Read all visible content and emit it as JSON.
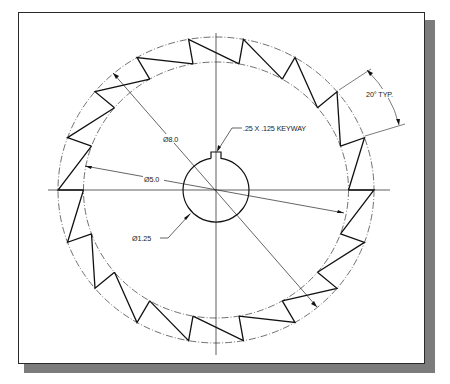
{
  "drawing": {
    "title": "Ratchet wheel detail",
    "center": {
      "x": 216,
      "y": 190
    },
    "outer_circle": {
      "rx": 158,
      "ry": 153,
      "label": "Ø8.0",
      "style": "dash-dot"
    },
    "root_circle": {
      "rx": 132.5,
      "ry": 128,
      "label": "Ø5.0",
      "style": "dash-dot"
    },
    "bore": {
      "rx": 33,
      "ry": 32,
      "label": "Ø1.25"
    },
    "keyway": {
      "label": ".25 X .125 KEYWAY",
      "half_width": 5,
      "depth": 6
    },
    "teeth": {
      "count": 18,
      "pitch_deg": 20,
      "start_deg": 0,
      "label": "20° TYP."
    },
    "colors": {
      "line": "#1a1a1a",
      "shadow": "#7c7c7c",
      "background": "#ffffff"
    }
  },
  "labels": {
    "outer_dia": "Ø8.0",
    "root_dia": "Ø5.0",
    "bore_dia": "Ø1.25",
    "keyway": ".25 X .125 KEYWAY",
    "tooth_angle": "20° TYP."
  }
}
